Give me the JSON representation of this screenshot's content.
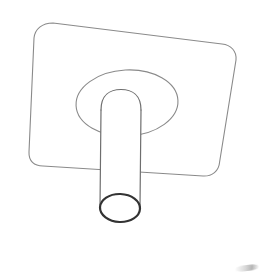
{
  "image": {
    "title": "Hand-drawn line sketch of a flat panel with cylindrical stand post",
    "subject": "display-back-panel-with-stand-post",
    "medium": "pencil line drawing",
    "background_color": "#ffffff",
    "width": 265,
    "height": 279
  },
  "colors": {
    "paper": "#ffffff",
    "line_light": "#8a8a8a",
    "line_mid": "#6e6e6e",
    "line_dark": "#333333",
    "smudge": "#7a7a7a"
  },
  "strokes": {
    "panel_width": 1.1,
    "ellipse_width": 1.1,
    "post_width": 1.2,
    "post_mouth_width": 2.2
  },
  "shapes": [
    {
      "name": "panel-plate",
      "label": "Rounded rectangle panel (tilted)",
      "type": "rounded-rect",
      "corner_radius": 18,
      "rotation_deg": -6.5,
      "corners": [
        {
          "label": "top-left",
          "x": 35,
          "y": 24
        },
        {
          "label": "top-right",
          "x": 236,
          "y": 44
        },
        {
          "label": "bottom-right",
          "x": 219,
          "y": 176
        },
        {
          "label": "bottom-left",
          "x": 28,
          "y": 163
        }
      ],
      "stroke": "#8a8a8a"
    },
    {
      "name": "mount-boss-ellipse",
      "label": "Large ellipse mounting boss",
      "type": "ellipse",
      "center_x": 127,
      "center_y": 103,
      "radius_x": 51,
      "radius_y": 33,
      "rotation_deg": -3,
      "stroke": "#8a8a8a"
    },
    {
      "name": "stand-post",
      "label": "Cylindrical stand post with domed top",
      "type": "cylinder",
      "top_center_x": 121,
      "top_center_y": 96,
      "bottom_center_x": 120,
      "bottom_center_y": 208,
      "radius": 20,
      "dome_height": 14,
      "tilt_deg": 3,
      "stroke": "#6e6e6e"
    },
    {
      "name": "post-open-mouth",
      "label": "Open end ellipse at bottom of post",
      "type": "ellipse",
      "center_x": 120,
      "center_y": 208,
      "radius_x": 20,
      "radius_y": 14,
      "rotation_deg": 2,
      "stroke": "#333333"
    },
    {
      "name": "corner-smudge",
      "label": "Faint pencil smudge in lower right corner",
      "type": "smudge",
      "x": 236,
      "y": 264,
      "width": 24,
      "height": 6
    }
  ]
}
